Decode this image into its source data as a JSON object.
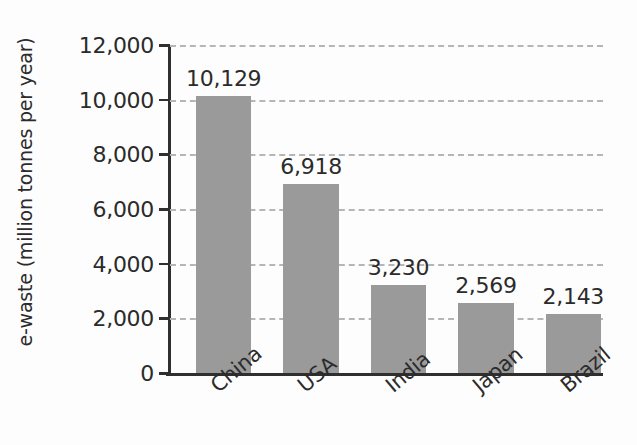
{
  "chart_data": {
    "type": "bar",
    "title": "",
    "xlabel": "",
    "ylabel": "e-waste (million tonnes per year)",
    "categories": [
      "China",
      "USA",
      "India",
      "Japan",
      "Brazil"
    ],
    "values": [
      10129,
      6918,
      3230,
      2569,
      2143
    ],
    "value_labels": [
      "10,129",
      "6,918",
      "3,230",
      "2,569",
      "2,143"
    ],
    "ylim": [
      0,
      12000
    ],
    "ytick_values": [
      0,
      2000,
      4000,
      6000,
      8000,
      10000,
      12000
    ],
    "ytick_labels": [
      "0",
      "2,000",
      "4,000",
      "6,000",
      "8,000",
      "10,000",
      "12,000"
    ],
    "grid": true,
    "grid_style": "dashed-horizontal",
    "legend": false,
    "legend_position": "none",
    "bar_color": "#9a9a9a",
    "axis_color": "#2f2f2f",
    "gridline_color": "#b6b6b6",
    "text_color": "#2b2b2b",
    "background_color": "#fdfdfd",
    "x_label_rotation": -40
  }
}
